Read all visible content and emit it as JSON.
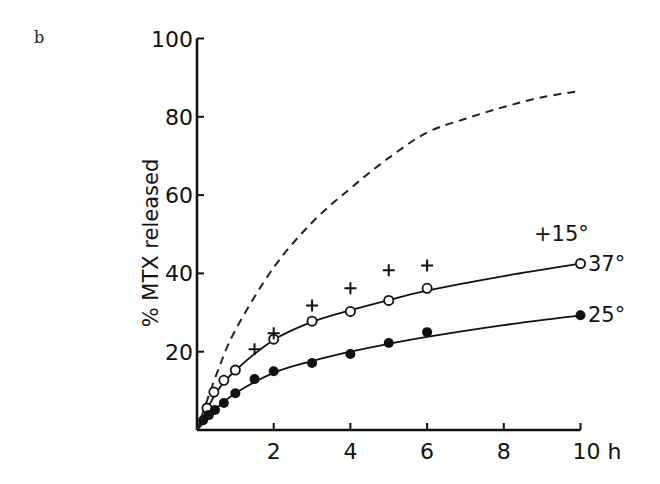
{
  "figure": {
    "panel_letter": "b"
  },
  "chart_data": {
    "type": "scatter",
    "title": "",
    "xlabel": "h",
    "ylabel": "% MTX released",
    "xlim": [
      0,
      10
    ],
    "ylim": [
      0,
      100
    ],
    "x_ticks": [
      2,
      4,
      6,
      8,
      10
    ],
    "x_tick_labels": [
      "2",
      "4",
      "6",
      "8",
      "10 h"
    ],
    "y_ticks": [
      20,
      40,
      60,
      80,
      100
    ],
    "y_tick_labels": [
      "20",
      "40",
      "60",
      "80",
      "100"
    ],
    "grid": false,
    "legend": "inline labels at curve ends",
    "series": [
      {
        "name": "37°",
        "marker": "open-circle",
        "line": "solid fitted curve",
        "x": [
          0.26,
          0.44,
          0.7,
          1.0,
          2.0,
          3.0,
          4.0,
          5.0,
          6.0,
          10.0
        ],
        "y": [
          5.6,
          9.7,
          12.7,
          15.3,
          23.2,
          27.8,
          30.3,
          33.1,
          36.2,
          42.5
        ]
      },
      {
        "name": "25°",
        "marker": "filled-circle",
        "line": "solid fitted curve",
        "x": [
          0.16,
          0.31,
          0.47,
          0.7,
          1.0,
          1.5,
          2.0,
          3.0,
          4.0,
          5.0,
          6.0,
          10.0
        ],
        "y": [
          2.5,
          3.8,
          5.1,
          6.9,
          9.4,
          13.0,
          15.0,
          17.1,
          19.4,
          22.2,
          25.0,
          29.3
        ]
      },
      {
        "name": "15°",
        "marker": "plus",
        "line": "none",
        "x": [
          1.5,
          2.0,
          3.0,
          4.0,
          5.0,
          6.0
        ],
        "y": [
          20.6,
          24.7,
          31.8,
          36.2,
          40.8,
          42.0
        ]
      },
      {
        "name": "reference (dashed)",
        "marker": "none",
        "line": "dashed",
        "x": [
          0,
          0.5,
          1,
          2,
          3,
          4,
          5,
          6,
          7,
          8,
          9,
          10
        ],
        "y": [
          0,
          14,
          25.5,
          41.5,
          53,
          61.7,
          69.5,
          76,
          79.5,
          82.5,
          85,
          86.6
        ]
      }
    ],
    "annotations": [
      "+15°",
      "37°",
      "25°"
    ]
  }
}
